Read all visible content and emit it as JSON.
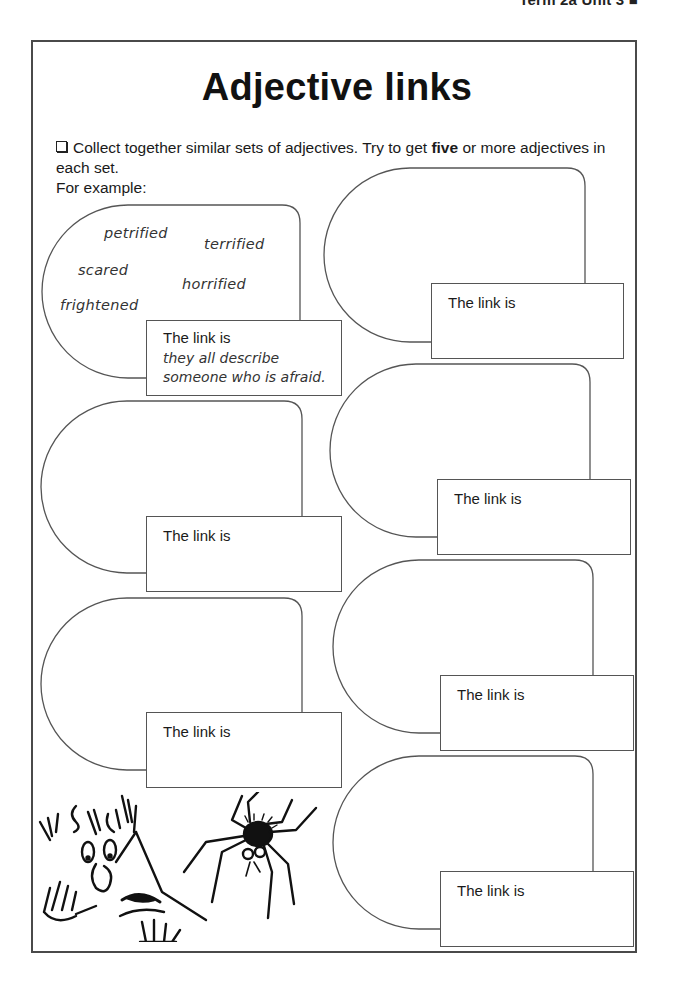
{
  "header": {
    "running_head": "Term 2a  Unit 3 ■"
  },
  "worksheet": {
    "title": "Adjective links",
    "instruction_before_bold": "Collect together similar sets of adjectives. Try to get ",
    "instruction_bold": "five",
    "instruction_after_bold": " or more adjectives in each set.",
    "example_intro": "For example:"
  },
  "example": {
    "adjectives": [
      "petrified",
      "terrified",
      "scared",
      "horrified",
      "frightened"
    ],
    "link_label": "The link is",
    "link_answer_line1": "they all describe",
    "link_answer_line2": "someone who is afraid."
  },
  "blank_sets": [
    {
      "link_label": "The link is",
      "column": "right",
      "position": 1
    },
    {
      "link_label": "The link is",
      "column": "left",
      "position": 2
    },
    {
      "link_label": "The link is",
      "column": "right",
      "position": 2
    },
    {
      "link_label": "The link is",
      "column": "left",
      "position": 3
    },
    {
      "link_label": "The link is",
      "column": "right",
      "position": 3
    },
    {
      "link_label": "The link is",
      "column": "right",
      "position": 4
    }
  ],
  "illustration": {
    "description": "frightened person with hair standing on end looking at a hairy spider"
  },
  "colors": {
    "outline": "#555555",
    "frame": "#4a4a4a",
    "text": "#1a1a1a"
  }
}
